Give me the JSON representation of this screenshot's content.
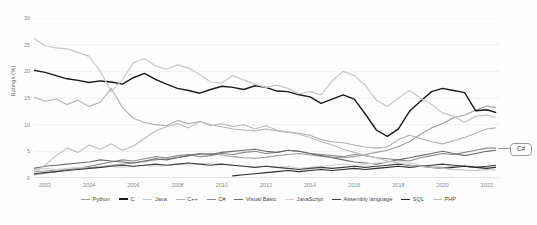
{
  "chart_data": {
    "type": "line",
    "title": "",
    "xlabel": "",
    "ylabel": "Ratings (%)",
    "xlim": [
      2001.5,
      2022.6
    ],
    "ylim": [
      0,
      30
    ],
    "yticks": [
      0,
      5,
      10,
      15,
      20,
      25,
      30
    ],
    "xticks": [
      2002,
      2004,
      2006,
      2008,
      2010,
      2012,
      2014,
      2016,
      2018,
      2020,
      2022
    ],
    "grid": "horizontal",
    "legend_position": "bottom",
    "annotations": [
      {
        "text": "C#",
        "x": 2022.6,
        "y": 5.6
      }
    ],
    "series": [
      {
        "name": "Python",
        "color": "#9d9d9d",
        "width": 1.1,
        "x": [
          2001.5,
          2002,
          2002.5,
          2003,
          2003.5,
          2004,
          2004.5,
          2005,
          2005.5,
          2006,
          2006.5,
          2007,
          2007.5,
          2008,
          2008.5,
          2009,
          2009.5,
          2010,
          2010.5,
          2011,
          2011.5,
          2012,
          2012.5,
          2013,
          2013.5,
          2014,
          2014.5,
          2015,
          2015.5,
          2016,
          2016.5,
          2017,
          2017.5,
          2018,
          2018.5,
          2019,
          2019.5,
          2020,
          2020.5,
          2021,
          2021.5,
          2022,
          2022.4
        ],
        "values": [
          1.2,
          1.3,
          1.5,
          1.6,
          1.8,
          2.0,
          2.1,
          2.4,
          2.6,
          2.8,
          3.1,
          3.4,
          3.6,
          3.9,
          4.2,
          4.4,
          4.6,
          4.3,
          4.0,
          3.8,
          3.7,
          3.9,
          4.2,
          4.4,
          4.6,
          4.3,
          4.1,
          3.9,
          3.8,
          4.0,
          4.4,
          4.8,
          5.2,
          5.9,
          6.8,
          8.2,
          9.4,
          10.2,
          11.3,
          11.8,
          12.7,
          13.5,
          13.2
        ]
      },
      {
        "name": "C",
        "color": "#1a1a1a",
        "width": 1.4,
        "x": [
          2001.5,
          2002,
          2002.5,
          2003,
          2003.5,
          2004,
          2004.5,
          2005,
          2005.5,
          2006,
          2006.5,
          2007,
          2007.5,
          2008,
          2008.5,
          2009,
          2009.5,
          2010,
          2010.5,
          2011,
          2011.5,
          2012,
          2012.5,
          2013,
          2013.5,
          2014,
          2014.5,
          2015,
          2015.5,
          2016,
          2016.5,
          2017,
          2017.5,
          2018,
          2018.5,
          2019,
          2019.5,
          2020,
          2020.5,
          2021,
          2021.5,
          2022,
          2022.4
        ],
        "values": [
          20.2,
          19.8,
          19.2,
          18.6,
          18.3,
          17.9,
          18.2,
          18.0,
          17.6,
          18.8,
          19.6,
          18.5,
          17.6,
          16.8,
          16.4,
          15.9,
          16.6,
          17.2,
          17.0,
          16.6,
          17.3,
          17.0,
          16.3,
          16.2,
          15.6,
          15.2,
          14.0,
          14.8,
          15.6,
          14.8,
          12.0,
          9.0,
          7.8,
          9.2,
          12.5,
          14.4,
          16.2,
          16.8,
          16.4,
          16.0,
          12.6,
          12.8,
          12.3
        ]
      },
      {
        "name": "Java",
        "color": "#c8c8c8",
        "width": 1.2,
        "x": [
          2001.5,
          2002,
          2002.5,
          2003,
          2003.5,
          2004,
          2004.5,
          2005,
          2005.5,
          2006,
          2006.5,
          2007,
          2007.5,
          2008,
          2008.5,
          2009,
          2009.5,
          2010,
          2010.5,
          2011,
          2011.5,
          2012,
          2012.5,
          2013,
          2013.5,
          2014,
          2014.5,
          2015,
          2015.5,
          2016,
          2016.5,
          2017,
          2017.5,
          2018,
          2018.5,
          2019,
          2019.5,
          2020,
          2020.5,
          2021,
          2021.5,
          2022,
          2022.4
        ],
        "values": [
          26.2,
          24.8,
          24.4,
          24.2,
          23.5,
          22.8,
          20.0,
          16.2,
          18.4,
          21.6,
          22.4,
          21.0,
          20.4,
          21.2,
          20.6,
          19.4,
          18.0,
          17.8,
          19.2,
          18.4,
          17.6,
          17.0,
          17.4,
          16.8,
          15.8,
          16.2,
          15.6,
          18.2,
          20.0,
          19.2,
          17.4,
          14.6,
          13.4,
          15.0,
          16.4,
          15.0,
          13.8,
          12.2,
          11.6,
          10.4,
          11.6,
          11.8,
          11.4
        ]
      },
      {
        "name": "C++",
        "color": "#b0b0b0",
        "width": 1.1,
        "x": [
          2001.5,
          2002,
          2002.5,
          2003,
          2003.5,
          2004,
          2004.5,
          2005,
          2005.5,
          2006,
          2006.5,
          2007,
          2007.5,
          2008,
          2008.5,
          2009,
          2009.5,
          2010,
          2010.5,
          2011,
          2011.5,
          2012,
          2012.5,
          2013,
          2013.5,
          2014,
          2014.5,
          2015,
          2015.5,
          2016,
          2016.5,
          2017,
          2017.5,
          2018,
          2018.5,
          2019,
          2019.5,
          2020,
          2020.5,
          2021,
          2021.5,
          2022,
          2022.4
        ],
        "values": [
          15.2,
          14.4,
          14.8,
          13.8,
          14.6,
          13.4,
          14.2,
          16.8,
          13.2,
          11.2,
          10.4,
          10.0,
          9.8,
          10.8,
          10.2,
          10.6,
          10.0,
          9.6,
          9.2,
          9.0,
          8.8,
          9.2,
          8.8,
          8.6,
          8.4,
          8.0,
          7.2,
          6.8,
          6.6,
          6.2,
          5.8,
          5.6,
          5.8,
          7.2,
          8.0,
          7.4,
          6.8,
          6.4,
          7.0,
          7.6,
          8.4,
          9.2,
          9.4
        ]
      },
      {
        "name": "C#",
        "color": "#8c8c8c",
        "width": 1.1,
        "x": [
          2001.5,
          2002,
          2002.5,
          2003,
          2003.5,
          2004,
          2004.5,
          2005,
          2005.5,
          2006,
          2006.5,
          2007,
          2007.5,
          2008,
          2008.5,
          2009,
          2009.5,
          2010,
          2010.5,
          2011,
          2011.5,
          2012,
          2012.5,
          2013,
          2013.5,
          2014,
          2014.5,
          2015,
          2015.5,
          2016,
          2016.5,
          2017,
          2017.5,
          2018,
          2018.5,
          2019,
          2019.5,
          2020,
          2020.5,
          2021,
          2021.5,
          2022,
          2022.4
        ],
        "values": [
          0.6,
          0.9,
          1.2,
          1.5,
          1.8,
          2.2,
          2.6,
          3.0,
          3.4,
          3.2,
          3.6,
          4.0,
          3.8,
          4.2,
          4.4,
          4.0,
          4.2,
          4.6,
          4.4,
          4.8,
          5.0,
          4.6,
          4.8,
          5.2,
          5.0,
          4.6,
          4.4,
          4.2,
          4.0,
          4.4,
          4.2,
          3.8,
          3.6,
          3.4,
          3.2,
          3.8,
          4.2,
          4.6,
          4.4,
          4.8,
          5.2,
          5.6,
          5.6
        ]
      },
      {
        "name": "Visual Basic",
        "color": "#6b6b6b",
        "width": 1.1,
        "x": [
          2001.5,
          2002,
          2002.5,
          2003,
          2003.5,
          2004,
          2004.5,
          2005,
          2005.5,
          2006,
          2006.5,
          2007,
          2007.5,
          2008,
          2008.5,
          2009,
          2009.5,
          2010,
          2010.5,
          2011,
          2011.5,
          2012,
          2012.5,
          2013,
          2013.5,
          2014,
          2014.5,
          2015,
          2015.5,
          2016,
          2016.5,
          2017,
          2017.5,
          2018,
          2018.5,
          2019,
          2019.5,
          2020,
          2020.5,
          2021,
          2021.5,
          2022,
          2022.4
        ],
        "values": [
          1.8,
          2.2,
          2.4,
          2.6,
          2.8,
          3.0,
          3.4,
          3.2,
          3.0,
          2.8,
          3.2,
          3.6,
          3.4,
          3.8,
          4.2,
          4.6,
          4.4,
          4.8,
          5.0,
          5.2,
          5.4,
          5.0,
          4.8,
          5.2,
          5.0,
          4.6,
          4.2,
          3.8,
          3.4,
          3.0,
          2.8,
          2.6,
          3.0,
          3.4,
          3.8,
          4.2,
          4.6,
          5.0,
          4.6,
          4.2,
          4.6,
          5.0,
          5.2
        ]
      },
      {
        "name": "JavaScript",
        "color": "#d2d2d2",
        "width": 1.1,
        "x": [
          2001.5,
          2002,
          2002.5,
          2003,
          2003.5,
          2004,
          2004.5,
          2005,
          2005.5,
          2006,
          2006.5,
          2007,
          2007.5,
          2008,
          2008.5,
          2009,
          2009.5,
          2010,
          2010.5,
          2011,
          2011.5,
          2012,
          2012.5,
          2013,
          2013.5,
          2014,
          2014.5,
          2015,
          2015.5,
          2016,
          2016.5,
          2017,
          2017.5,
          2018,
          2018.5,
          2019,
          2019.5,
          2020,
          2020.5,
          2021,
          2021.5,
          2022,
          2022.4
        ],
        "values": [
          1.6,
          1.8,
          1.6,
          1.8,
          2.0,
          1.8,
          2.0,
          2.2,
          2.0,
          2.2,
          2.4,
          2.2,
          2.4,
          2.6,
          2.4,
          2.6,
          2.8,
          2.6,
          2.4,
          2.2,
          2.0,
          2.2,
          2.0,
          2.2,
          1.8,
          2.0,
          2.2,
          2.4,
          2.6,
          2.4,
          2.6,
          2.8,
          3.0,
          3.2,
          2.8,
          2.4,
          2.2,
          2.0,
          2.2,
          2.4,
          2.2,
          2.0,
          2.2
        ]
      },
      {
        "name": "Assembly language",
        "color": "#3d3d3d",
        "width": 1.1,
        "x": [
          2001.5,
          2002,
          2002.5,
          2003,
          2003.5,
          2004,
          2004.5,
          2005,
          2005.5,
          2006,
          2006.5,
          2007,
          2007.5,
          2008,
          2008.5,
          2009,
          2009.5,
          2010,
          2010.5,
          2011,
          2011.5,
          2012,
          2012.5,
          2013,
          2013.5,
          2014,
          2014.5,
          2015,
          2015.5,
          2016,
          2016.5,
          2017,
          2017.5,
          2018,
          2018.5,
          2019,
          2019.5,
          2020,
          2020.5,
          2021,
          2021.5,
          2022,
          2022.4
        ],
        "values": [
          0.8,
          1.0,
          1.2,
          1.4,
          1.6,
          1.8,
          2.0,
          2.2,
          2.4,
          2.2,
          2.4,
          2.6,
          2.4,
          2.6,
          2.8,
          2.6,
          2.4,
          2.6,
          2.4,
          2.2,
          2.0,
          2.2,
          2.0,
          1.8,
          1.6,
          1.8,
          2.0,
          1.8,
          2.0,
          2.2,
          2.0,
          2.2,
          2.4,
          2.6,
          2.4,
          2.2,
          2.4,
          2.6,
          2.4,
          2.2,
          2.0,
          2.2,
          2.4
        ]
      },
      {
        "name": "SQL",
        "color": "#2b2b2b",
        "width": 1.1,
        "x": [
          2010.5,
          2011,
          2011.5,
          2012,
          2012.5,
          2013,
          2013.5,
          2014,
          2014.5,
          2015,
          2015.5,
          2016,
          2016.5,
          2017,
          2017.5,
          2018,
          2018.5,
          2019,
          2019.5,
          2020,
          2020.5,
          2021,
          2021.5,
          2022,
          2022.4
        ],
        "values": [
          0.4,
          0.6,
          0.8,
          1.0,
          1.2,
          1.4,
          1.2,
          1.4,
          1.6,
          1.4,
          1.6,
          1.8,
          1.6,
          1.8,
          2.0,
          2.2,
          2.0,
          2.2,
          2.0,
          1.8,
          2.0,
          2.2,
          2.0,
          1.8,
          2.0
        ]
      },
      {
        "name": "PHP",
        "color": "#bdbdbd",
        "width": 1.1,
        "x": [
          2001.5,
          2002,
          2002.5,
          2003,
          2003.5,
          2004,
          2004.5,
          2005,
          2005.5,
          2006,
          2006.5,
          2007,
          2007.5,
          2008,
          2008.5,
          2009,
          2009.5,
          2010,
          2010.5,
          2011,
          2011.5,
          2012,
          2012.5,
          2013,
          2013.5,
          2014,
          2014.5,
          2015,
          2015.5,
          2016,
          2016.5,
          2017,
          2017.5,
          2018,
          2018.5,
          2019,
          2019.5,
          2020,
          2020.5,
          2021,
          2021.5,
          2022,
          2022.4
        ],
        "values": [
          1.2,
          2.4,
          4.2,
          5.6,
          4.8,
          6.2,
          5.4,
          6.4,
          5.2,
          6.0,
          7.4,
          8.8,
          9.6,
          10.2,
          9.4,
          10.6,
          9.8,
          10.2,
          9.6,
          10.0,
          9.2,
          9.8,
          9.0,
          8.6,
          8.2,
          7.6,
          6.8,
          6.2,
          5.4,
          4.8,
          4.2,
          3.8,
          3.2,
          2.8,
          2.4,
          2.2,
          2.0,
          1.8,
          1.6,
          1.5,
          1.4,
          1.6,
          1.5
        ]
      }
    ]
  }
}
